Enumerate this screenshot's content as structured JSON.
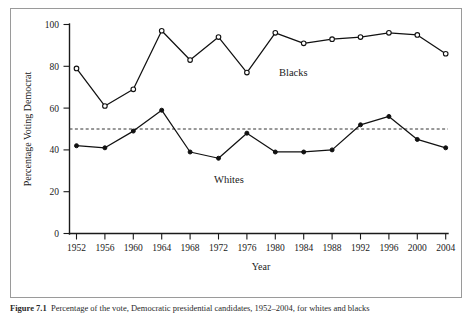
{
  "figure": {
    "caption_label": "Figure 7.1",
    "caption_text": "Percentage of the vote, Democratic presidential candidates, 1952–2004, for whites and blacks"
  },
  "chart_data": {
    "type": "line",
    "title": "",
    "xlabel": "Year",
    "ylabel": "Percentage Voting Democrat",
    "xlim": [
      1950,
      2006
    ],
    "ylim": [
      0,
      100
    ],
    "yticks": [
      0,
      20,
      40,
      60,
      80,
      100
    ],
    "ytick_labels": [
      "0",
      "20",
      "40",
      "60",
      "80",
      "100"
    ],
    "grid": false,
    "legend_position": "inline-annotation",
    "categories": [
      1952,
      1956,
      1960,
      1964,
      1968,
      1972,
      1976,
      1980,
      1984,
      1988,
      1992,
      1996,
      2000,
      2004
    ],
    "xtick_labels": [
      "1952",
      "1956",
      "1960",
      "1964",
      "1968",
      "1972",
      "1976",
      "1980",
      "1984",
      "1988",
      "1992",
      "1996",
      "2000",
      "2004"
    ],
    "series": [
      {
        "name": "Blacks",
        "marker": "open-circle",
        "label_x": 1979,
        "label_y": 71,
        "values": [
          79,
          61,
          69,
          97,
          83,
          94,
          77,
          96,
          91,
          93,
          94,
          96,
          95,
          86
        ]
      },
      {
        "name": "Whites",
        "marker": "filled-circle",
        "label_x": 1975,
        "label_y": 30,
        "values": [
          42,
          41,
          49,
          59,
          39,
          36,
          48,
          39,
          39,
          40,
          52,
          56,
          45,
          41
        ]
      }
    ],
    "annotations": [
      {
        "name": "fifty-percent-reference-line",
        "type": "hline",
        "value": 50,
        "style": "dashed"
      }
    ]
  }
}
